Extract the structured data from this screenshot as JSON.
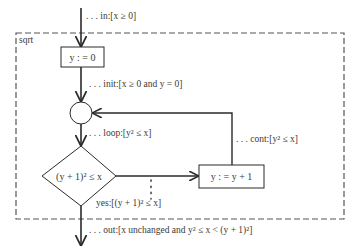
{
  "diagram": {
    "region_label": "sqrt",
    "nodes": {
      "init_box": "y : = 0",
      "decision": "(y + 1)² ≤ x",
      "increment_box": "y : = y + 1"
    },
    "annotations": {
      "in": ". . . in:[x ≥ 0]",
      "init": ". . . init:[x ≥ 0 and y = 0]",
      "loop": ". . . loop:[y² ≤ x]",
      "cont": ". . . cont:[y² ≤ x]",
      "yes": "yes:[(y + 1)² ≤ x]",
      "out": ". . . out:[x unchanged and y² ≤ x < (y + 1)²]"
    },
    "colors": {
      "line": "#2a2a2a",
      "dashed_border": "#555555",
      "text": "#3a3a3a"
    }
  }
}
